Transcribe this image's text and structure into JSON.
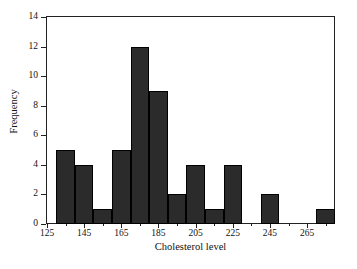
{
  "chart_data": {
    "type": "bar",
    "title": "",
    "subtitle": "",
    "xlabel": "Cholesterol level",
    "ylabel": "Frequency",
    "xlim": [
      125,
      280
    ],
    "ylim": [
      0,
      14
    ],
    "grid": false,
    "legend": null,
    "bin_width": 10,
    "bar_color": "#2b2b2b",
    "axis_color": "#222222",
    "background": "#ffffff",
    "bin_starts": [
      130,
      140,
      150,
      160,
      170,
      180,
      190,
      200,
      210,
      220,
      230,
      240,
      250,
      260,
      270
    ],
    "bin_ends": [
      140,
      150,
      160,
      170,
      180,
      190,
      200,
      210,
      220,
      230,
      240,
      250,
      260,
      270,
      280
    ],
    "categories": [
      "130-140",
      "140-150",
      "150-160",
      "160-170",
      "170-180",
      "180-190",
      "190-200",
      "200-210",
      "210-220",
      "220-230",
      "230-240",
      "240-250",
      "250-260",
      "260-270",
      "270-280"
    ],
    "values": [
      5,
      4,
      1,
      5,
      12,
      9,
      2,
      4,
      1,
      4,
      0,
      2,
      0,
      0,
      1
    ],
    "x_tick_values": [
      125,
      145,
      165,
      185,
      205,
      225,
      245,
      265
    ],
    "x_tick_labels": [
      "125",
      "145",
      "165",
      "185",
      "205",
      "225",
      "245",
      "265"
    ],
    "x_minor_tick_values": [
      135,
      155,
      175,
      195,
      215,
      235,
      255,
      275
    ],
    "y_tick_values": [
      0,
      2,
      4,
      6,
      8,
      10,
      12,
      14
    ],
    "y_tick_labels": [
      "0",
      "2",
      "4",
      "6",
      "8",
      "10",
      "12",
      "14"
    ]
  }
}
